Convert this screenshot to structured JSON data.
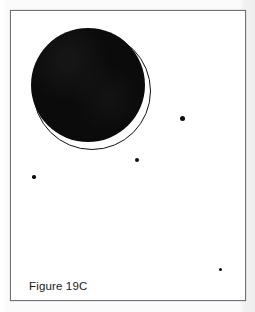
{
  "figure": {
    "caption": "Figure 19C",
    "background_color": "#ffffff",
    "frame": {
      "border_color": "#6f7276",
      "x": 10,
      "y": 10,
      "width": 236,
      "height": 291
    },
    "shapes": {
      "filled_disk": {
        "name": "large-black-disk",
        "fill_color": "#0b0b0b",
        "cx": 87,
        "cy": 84,
        "diameter": 114
      },
      "outline_circle": {
        "name": "thin-outline-circle",
        "stroke_color": "#111111",
        "stroke_width": 1.3,
        "cx": 91,
        "cy": 90,
        "diameter": 118
      }
    },
    "dots": [
      {
        "name": "dot-right-upper",
        "cx": 181,
        "cy": 117,
        "diameter": 5.0,
        "color": "#0d0d0d"
      },
      {
        "name": "dot-center-lower",
        "cx": 136,
        "cy": 159,
        "diameter": 4.2,
        "color": "#0d0d0d"
      },
      {
        "name": "dot-left-lower",
        "cx": 33,
        "cy": 176,
        "diameter": 3.4,
        "color": "#0d0d0d"
      },
      {
        "name": "dot-bottom-right",
        "cx": 219,
        "cy": 268,
        "diameter": 3.0,
        "color": "#0d0d0d"
      }
    ]
  }
}
